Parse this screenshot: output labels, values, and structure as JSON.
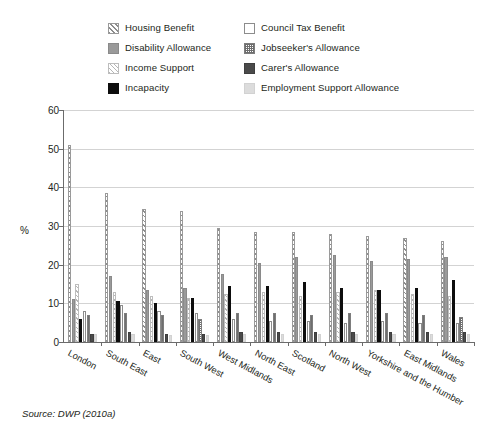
{
  "legend": {
    "items": [
      {
        "label": "Housing Benefit",
        "pattern": "diagonal-hatch",
        "color": "#8d8d8d",
        "col": "left"
      },
      {
        "label": "Council Tax Benefit",
        "pattern": "white-outline",
        "color": "#ffffff",
        "col": "right"
      },
      {
        "label": "Disability Allowance",
        "pattern": "solid-gray",
        "color": "#9a9a9a",
        "col": "left"
      },
      {
        "label": "Jobseeker's Allowance",
        "pattern": "checkered",
        "color": "#6e6e6e",
        "col": "right"
      },
      {
        "label": "Income Support",
        "pattern": "light-diagonal-hatch",
        "color": "#b6b6b6",
        "col": "left"
      },
      {
        "label": "Carer's Allowance",
        "pattern": "solid-dark-gray",
        "color": "#4a4a4a",
        "col": "right"
      },
      {
        "label": "Incapacity",
        "pattern": "solid-black",
        "color": "#0d0d0d",
        "col": "left"
      },
      {
        "label": "Employment Support Allowance",
        "pattern": "solid-light-gray",
        "color": "#dcdcdc",
        "col": "right"
      }
    ]
  },
  "source": "Source: DWP (2010a)",
  "chart_data": {
    "type": "bar",
    "title": "",
    "xlabel": "",
    "ylabel": "%",
    "ylim": [
      0,
      60
    ],
    "yticks": [
      0,
      10,
      20,
      30,
      40,
      50,
      60
    ],
    "grid": true,
    "legend_position": "top",
    "categories": [
      "London",
      "South East",
      "East",
      "South West",
      "West Midlands",
      "North East",
      "Scotland",
      "North West",
      "Yorkshire and the Humber",
      "East Midlands",
      "Wales"
    ],
    "series": [
      {
        "name": "Housing Benefit",
        "values": [
          51.0,
          38.5,
          34.5,
          34.0,
          29.5,
          28.5,
          28.5,
          28.0,
          27.5,
          27.0,
          26.0
        ]
      },
      {
        "name": "Disability Allowance",
        "values": [
          11.0,
          17.0,
          13.5,
          14.0,
          17.5,
          20.5,
          22.0,
          22.5,
          21.0,
          21.5,
          22.0
        ]
      },
      {
        "name": "Income Support",
        "values": [
          15.0,
          13.0,
          12.0,
          11.5,
          12.5,
          13.0,
          12.0,
          13.0,
          13.5,
          12.5,
          12.0
        ]
      },
      {
        "name": "Incapacity",
        "values": [
          6.0,
          10.5,
          10.0,
          11.5,
          14.5,
          14.5,
          15.5,
          14.0,
          13.5,
          14.0,
          16.0
        ]
      },
      {
        "name": "Council Tax Benefit",
        "values": [
          8.0,
          9.5,
          8.0,
          7.5,
          6.0,
          5.5,
          5.5,
          5.0,
          5.5,
          5.0,
          5.0
        ]
      },
      {
        "name": "Jobseeker's Allowance",
        "values": [
          7.0,
          7.5,
          7.0,
          6.0,
          7.5,
          7.5,
          7.0,
          7.5,
          7.5,
          7.0,
          6.5
        ]
      },
      {
        "name": "Carer's Allowance",
        "values": [
          2.0,
          2.5,
          2.0,
          2.0,
          2.5,
          2.5,
          2.5,
          2.5,
          2.5,
          2.5,
          2.5
        ]
      },
      {
        "name": "Employment Support Allowance",
        "values": [
          2.0,
          2.0,
          1.8,
          1.8,
          2.0,
          2.2,
          2.2,
          2.2,
          2.2,
          2.0,
          2.2
        ]
      }
    ]
  }
}
